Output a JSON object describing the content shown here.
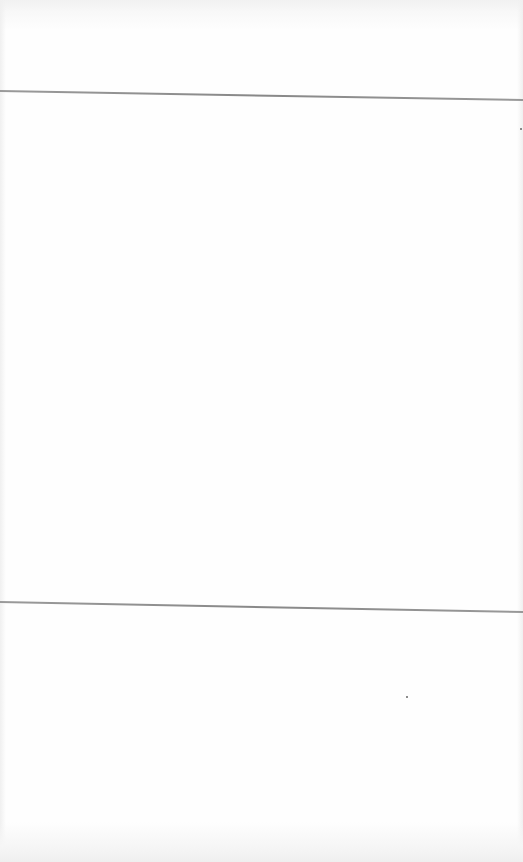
{
  "page": {
    "background": "#fefefe",
    "width": 523,
    "height": 862
  },
  "rules": [
    {
      "name": "upper-rule",
      "y_left": 90,
      "y_right": 99,
      "color": "#8c8c8c"
    },
    {
      "name": "lower-rule",
      "y_left": 601,
      "y_right": 611,
      "color": "#8c8c8c"
    }
  ],
  "specks": [
    {
      "x": 520,
      "y": 128
    },
    {
      "x": 406,
      "y": 696
    }
  ]
}
